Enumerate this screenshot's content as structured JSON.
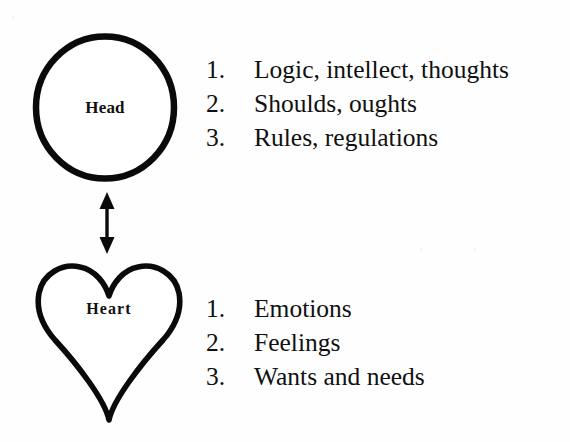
{
  "diagram": {
    "ink_color": "#0a0a0a",
    "background_color": "#fefefe",
    "nodes": [
      {
        "id": "head",
        "shape": "circle",
        "label": "Head",
        "items": [
          {
            "number": "1.",
            "text": "Logic, intellect, thoughts"
          },
          {
            "number": "2.",
            "text": "Shoulds, oughts"
          },
          {
            "number": "3.",
            "text": "Rules, regulations"
          }
        ]
      },
      {
        "id": "heart",
        "shape": "heart",
        "label": "Heart",
        "items": [
          {
            "number": "1.",
            "text": "Emotions"
          },
          {
            "number": "2.",
            "text": "Feelings"
          },
          {
            "number": "3.",
            "text": "Wants and needs"
          }
        ]
      }
    ],
    "connector": {
      "type": "double-headed-arrow",
      "orientation": "vertical",
      "from": "head",
      "to": "heart"
    }
  }
}
